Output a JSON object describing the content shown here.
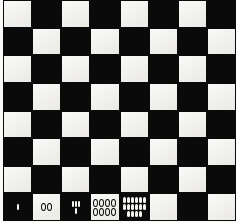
{
  "image": {
    "title": "Checkerboard with counting marks",
    "type": "photographed-checkerboard",
    "width": 236,
    "height": 223,
    "board": {
      "columns": 8,
      "rows": 8,
      "top_left_square": "light",
      "light_color": "#f4f3ef",
      "dark_color": "#0a0a0a",
      "border_color": "#0a0a0a",
      "background_color": "#fbfaf8"
    },
    "annotations": {
      "description": "Bottom row squares 1-5 contain small counting marks that double each square",
      "cells": [
        {
          "index": 1,
          "square": "dark",
          "mark_style": "white-pips",
          "count": 1,
          "rows": [
            1
          ],
          "label": "1"
        },
        {
          "index": 2,
          "square": "light",
          "mark_style": "dark-rings",
          "count": 2,
          "rows": [
            2
          ],
          "label": "00"
        },
        {
          "index": 3,
          "square": "dark",
          "mark_style": "white-pips",
          "count": 4,
          "rows": [
            3,
            1
          ],
          "label": "''' ."
        },
        {
          "index": 4,
          "square": "light",
          "mark_style": "dark-rings",
          "count": 8,
          "rows": [
            4,
            4
          ],
          "label": "0000 0000"
        },
        {
          "index": 5,
          "square": "dark",
          "mark_style": "white-pips",
          "count": 16,
          "rows": [
            6,
            6,
            4
          ],
          "label": "||||||"
        },
        {
          "index": 6,
          "square": "light",
          "mark_style": "none",
          "count": 0,
          "rows": [],
          "label": ""
        },
        {
          "index": 7,
          "square": "dark",
          "mark_style": "none",
          "count": 0,
          "rows": [],
          "label": ""
        },
        {
          "index": 8,
          "square": "light",
          "mark_style": "none",
          "count": 0,
          "rows": [],
          "label": ""
        }
      ]
    }
  }
}
